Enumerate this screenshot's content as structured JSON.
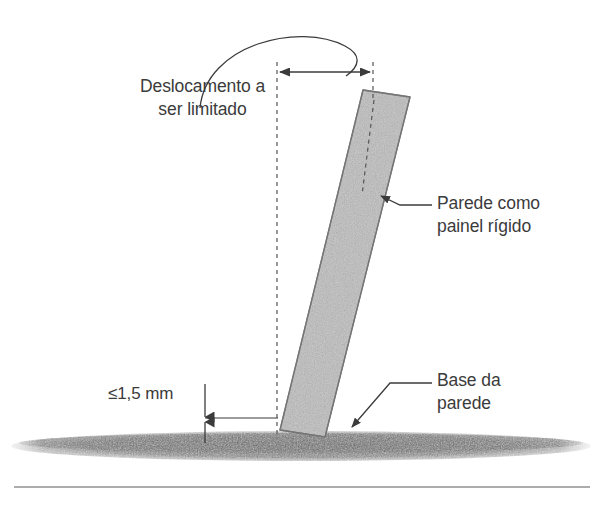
{
  "figure": {
    "background_color": "#ffffff",
    "line_color": "#3b3b3b",
    "panel_fill_color": "#b9b9b9",
    "panel_stroke_color": "#6e6e6e",
    "ground_color": "#6b6b6b",
    "text_color": "#3b3b3b"
  },
  "labels": {
    "displacement": "Deslocamento a\nser limitado",
    "wall_panel": "Parede como\npainel rígido",
    "wall_base": "Base da\nparede",
    "gap": "≤1,5 mm"
  },
  "annotations": {
    "dimension_displacement": {
      "name": "horizontal displacement dimension",
      "from_x": 277,
      "to_x": 373,
      "y": 72,
      "style": "double-arrow"
    },
    "dimension_gap": {
      "name": "vertical gap dimension",
      "x": 205,
      "top_y": 392,
      "bottom_y": 434,
      "value": "≤1,5 mm",
      "style": "double-arrow"
    },
    "reference_line": {
      "name": "vertical plumb reference",
      "x": 277,
      "top_y": 62,
      "bottom_y": 434,
      "style": "dashed"
    },
    "panel_centerline": {
      "name": "panel center dashed line",
      "style": "dashed"
    },
    "arc_leader": {
      "name": "curved leader from text to dimension",
      "style": "arc"
    }
  },
  "geometry": {
    "panel": {
      "top_left_x": 363,
      "top_left_y": 90,
      "top_right_x": 410,
      "top_right_y": 97,
      "bottom_right_x": 325,
      "bottom_right_y": 437,
      "bottom_left_x": 280,
      "bottom_left_y": 430,
      "tilt_description": "leaning right from base"
    },
    "ground": {
      "top_y": 432,
      "bottom_y": 462,
      "left_x": 18,
      "right_x": 585
    },
    "baseline_rule": {
      "y": 487,
      "left_x": 14,
      "right_x": 590
    }
  }
}
